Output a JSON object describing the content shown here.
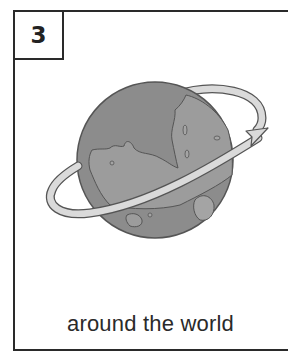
{
  "card": {
    "number": "3",
    "caption": "around the world",
    "illustration": "globe-with-orbit-arrow-icon"
  },
  "colors": {
    "border": "#2a2a2a",
    "ocean": "#8c8c8c",
    "land": "#9c9c9c",
    "ring": "#dadada",
    "outline": "#555555"
  }
}
